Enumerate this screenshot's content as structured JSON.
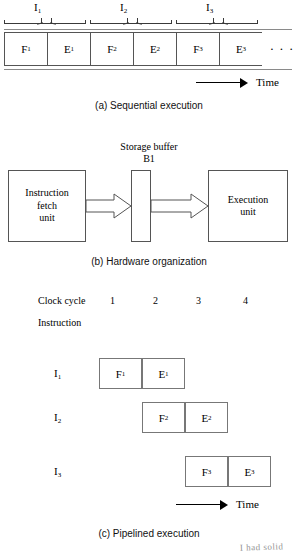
{
  "figure": {
    "title_hidden": "Instruction execution: sequential vs pipelined",
    "time_label": "Time"
  },
  "part_a": {
    "caption": "(a) Sequential execution",
    "group_labels": [
      {
        "text": "I",
        "sub": "1"
      },
      {
        "text": "I",
        "sub": "2"
      },
      {
        "text": "I",
        "sub": "3"
      }
    ],
    "cells": [
      {
        "text": "F",
        "sub": "1"
      },
      {
        "text": "E",
        "sub": "1"
      },
      {
        "text": "F",
        "sub": "2"
      },
      {
        "text": "E",
        "sub": "2"
      },
      {
        "text": "F",
        "sub": "3"
      },
      {
        "text": "E",
        "sub": "3"
      }
    ],
    "ellipsis": "· · ·",
    "time_label": "Time"
  },
  "part_b": {
    "caption": "(b) Hardware organization",
    "buffer_title_line1": "Storage buffer",
    "buffer_title_line2": "B1",
    "fetch_unit_line1": "Instruction",
    "fetch_unit_line2": "fetch",
    "fetch_unit_line3": "unit",
    "exec_unit_line1": "Execution",
    "exec_unit_line2": "unit"
  },
  "part_c": {
    "caption": "(c) Pipelined execution",
    "clock_cycle_label": "Clock cycle",
    "instruction_label": "Instruction",
    "clock_cycles": [
      "1",
      "2",
      "3",
      "4"
    ],
    "rows": [
      {
        "instr": "I",
        "instr_sub": "1",
        "offset": 0,
        "cells": [
          {
            "text": "F",
            "sub": "1"
          },
          {
            "text": "E",
            "sub": "1"
          }
        ]
      },
      {
        "instr": "I",
        "instr_sub": "2",
        "offset": 1,
        "cells": [
          {
            "text": "F",
            "sub": "2"
          },
          {
            "text": "E",
            "sub": "2"
          }
        ]
      },
      {
        "instr": "I",
        "instr_sub": "3",
        "offset": 2,
        "cells": [
          {
            "text": "F",
            "sub": "3"
          },
          {
            "text": "E",
            "sub": "3"
          }
        ]
      }
    ],
    "time_label": "Time"
  },
  "annotation": {
    "handwriting": "I had solid"
  },
  "colors": {
    "ink": "#000000",
    "box_border": "#555555",
    "cell_border": "#777777",
    "rule": "#8a8a8a",
    "handwriting": "#6e6e6e"
  }
}
